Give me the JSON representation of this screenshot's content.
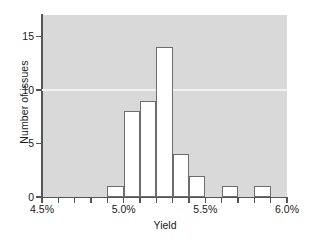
{
  "chart_data": {
    "type": "bar",
    "title": "",
    "subtitle": "",
    "xlabel": "Yield",
    "ylabel": "Number of issues",
    "categories": [
      "4.5%",
      "4.6%",
      "4.7%",
      "4.8%",
      "4.9%",
      "5.0%",
      "5.1%",
      "5.2%",
      "5.3%",
      "5.4%",
      "5.5%",
      "5.6%",
      "5.7%",
      "5.8%",
      "5.9%"
    ],
    "bin_edges": [
      4.5,
      4.6,
      4.7,
      4.8,
      4.9,
      5.0,
      5.1,
      5.2,
      5.3,
      5.4,
      5.5,
      5.6,
      5.7,
      5.8,
      5.9,
      6.0
    ],
    "values": [
      0,
      0,
      0,
      0,
      1,
      8,
      9,
      14,
      4,
      2,
      0,
      1,
      0,
      1,
      0
    ],
    "xlim": [
      4.5,
      6.0
    ],
    "ylim": [
      0,
      17
    ],
    "grid": true,
    "gridlines_y": [
      10
    ],
    "legend": null,
    "xtick_labels": [
      "4.5%",
      "5.0%",
      "5.5%",
      "6.0%"
    ],
    "xtick_values": [
      4.5,
      5.0,
      5.5,
      6.0
    ],
    "ytick_labels": [
      "0",
      "5",
      "10",
      "15"
    ],
    "ytick_values": [
      0,
      5,
      10,
      15
    ],
    "colors": {
      "plot_background": "#d9d9d9",
      "figure_background": "#ffffff",
      "bar_fill": "#ffffff",
      "bar_edge": "#6e6e6e",
      "axis": "#555555",
      "gridline": "#f2f2f2",
      "text": "#1a1a1a"
    }
  },
  "axes": {
    "x_title": "Yield",
    "y_title": "Number of issues"
  }
}
